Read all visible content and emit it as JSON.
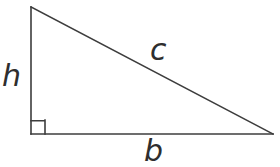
{
  "figure": {
    "background_color": "#ffffff",
    "stroke_color": "#3d3d3d",
    "label_color": "#2e2e2e",
    "stroke_width": 1.6,
    "width": 280,
    "height": 167
  },
  "chart_data": {
    "type": "diagram",
    "shape": "right-triangle",
    "vertices": [
      {
        "name": "apex",
        "x": 31,
        "y": 7
      },
      {
        "name": "right-angle-vertex",
        "x": 31,
        "y": 134
      },
      {
        "name": "right-vertex",
        "x": 273,
        "y": 134
      }
    ],
    "edges": [
      {
        "name": "vertical-leg",
        "label": "h",
        "from": "apex",
        "to": "right-angle-vertex",
        "length_px": 127
      },
      {
        "name": "horizontal-leg",
        "label": "b",
        "from": "right-angle-vertex",
        "to": "right-vertex",
        "length_px": 242
      },
      {
        "name": "hypotenuse",
        "label": "c",
        "from": "apex",
        "to": "right-vertex",
        "length_px": 273
      }
    ],
    "right_angle_marker": {
      "at": "right-angle-vertex",
      "size_px": 14,
      "x": 31,
      "y": 120
    },
    "grid": false,
    "legend": false
  },
  "labels": {
    "leg_vertical": "h",
    "hypotenuse": "c",
    "leg_horizontal": "b"
  },
  "geometry": {
    "triangle_points": "31,7 31,134 273,134",
    "vertical_leg": {
      "x1": 31,
      "y1": 7,
      "x2": 31,
      "y2": 134
    },
    "horizontal_leg": {
      "x1": 31,
      "y1": 134,
      "x2": 273,
      "y2": 134
    },
    "hypotenuse_line": {
      "x1": 31,
      "y1": 7,
      "x2": 273,
      "y2": 134
    },
    "right_angle_path": "M 45 120 L 45 134 M 31 120.8 L 45 120.8"
  }
}
